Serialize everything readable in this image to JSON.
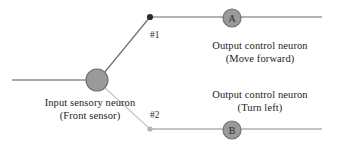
{
  "diagram": {
    "colors": {
      "background": "#ffffff",
      "node_fill": "#9a9a9a",
      "node_stroke": "#6e6e6e",
      "axon_line": "#8e8e8e",
      "branch_strong": "#6f6f6f",
      "branch_weak": "#c3c3c3",
      "dot_strong": "#2b2b2b",
      "dot_weak": "#b4b4b4",
      "text": "#1c1c1c"
    },
    "nodes": {
      "input": {
        "name": "input-sensory-neuron",
        "letter": "",
        "cx": 97,
        "cy": 80,
        "r": 11,
        "caption_line1": "Input sensory neuron",
        "caption_line2": "(Front sensor)"
      },
      "output_a": {
        "name": "output-control-neuron-a",
        "letter": "A",
        "cx": 232,
        "cy": 18,
        "r": 9,
        "caption_line1": "Output control neuron",
        "caption_line2": "(Move forward)"
      },
      "output_b": {
        "name": "output-control-neuron-b",
        "letter": "B",
        "cx": 232,
        "cy": 130,
        "r": 9,
        "caption_line1": "Output control neuron",
        "caption_line2": "(Turn left)"
      }
    },
    "synapses": [
      {
        "name": "synapse-1",
        "label": "#1",
        "x": 150,
        "y": 17,
        "weight": "strong"
      },
      {
        "name": "synapse-2",
        "label": "#2",
        "x": 150,
        "y": 129,
        "weight": "weak"
      }
    ]
  }
}
